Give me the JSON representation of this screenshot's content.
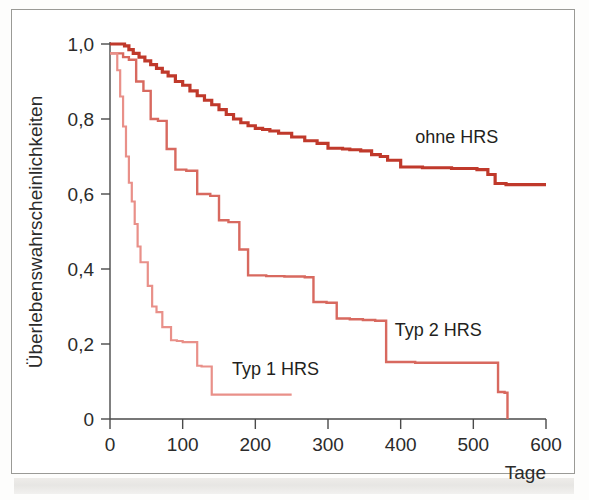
{
  "chart_data": {
    "type": "line",
    "subtype": "kaplan-meier-step",
    "title": "",
    "xlabel": "Tage",
    "ylabel": "Überlebenswahrscheinlichkeiten",
    "xlim": [
      0,
      600
    ],
    "ylim": [
      0,
      1.0
    ],
    "grid": false,
    "legend_position": "inline-annotations",
    "xticks": [
      0,
      100,
      200,
      300,
      400,
      500,
      600
    ],
    "xtick_labels": [
      "0",
      "100",
      "200",
      "300",
      "400",
      "500",
      "600"
    ],
    "yticks": [
      0,
      0.2,
      0.4,
      0.6,
      0.8,
      1.0
    ],
    "ytick_labels": [
      "0",
      "0,2",
      "0,4",
      "0,6",
      "0,8",
      "1,0"
    ],
    "series": [
      {
        "name": "ohne HRS",
        "color": "#C0392B",
        "label_text": "ohne HRS",
        "label_x": 420,
        "label_y": 0.735,
        "line_width": 3.2,
        "x": [
          0,
          14,
          20,
          26,
          32,
          40,
          48,
          56,
          64,
          72,
          80,
          90,
          100,
          110,
          120,
          130,
          140,
          150,
          160,
          170,
          180,
          190,
          200,
          210,
          220,
          232,
          250,
          268,
          285,
          300,
          320,
          330,
          345,
          360,
          372,
          382,
          400,
          430,
          470,
          505,
          520,
          530,
          545,
          600
        ],
        "y": [
          1.0,
          1.0,
          0.995,
          0.985,
          0.975,
          0.965,
          0.955,
          0.945,
          0.935,
          0.925,
          0.915,
          0.9,
          0.89,
          0.875,
          0.862,
          0.85,
          0.838,
          0.825,
          0.812,
          0.8,
          0.79,
          0.782,
          0.775,
          0.772,
          0.768,
          0.762,
          0.752,
          0.742,
          0.735,
          0.722,
          0.72,
          0.718,
          0.715,
          0.705,
          0.7,
          0.69,
          0.672,
          0.67,
          0.668,
          0.665,
          0.652,
          0.628,
          0.625,
          0.625
        ]
      },
      {
        "name": "Typ 2 HRS",
        "color": "#D8695F",
        "label_text": "Typ 2 HRS",
        "label_x": 392,
        "label_y": 0.222,
        "line_width": 2.4,
        "x": [
          0,
          10,
          18,
          26,
          36,
          46,
          56,
          66,
          78,
          90,
          105,
          120,
          138,
          150,
          163,
          178,
          190,
          215,
          240,
          268,
          280,
          298,
          312,
          330,
          348,
          365,
          380,
          420,
          470,
          505,
          522,
          534,
          543,
          547
        ],
        "y": [
          0.975,
          0.975,
          0.965,
          0.958,
          0.9,
          0.875,
          0.8,
          0.795,
          0.72,
          0.665,
          0.662,
          0.6,
          0.595,
          0.53,
          0.525,
          0.452,
          0.383,
          0.381,
          0.38,
          0.378,
          0.312,
          0.31,
          0.268,
          0.266,
          0.264,
          0.262,
          0.152,
          0.15,
          0.15,
          0.15,
          0.15,
          0.072,
          0.07,
          0.0
        ]
      },
      {
        "name": "Typ 1 HRS",
        "color": "#E99089",
        "label_text": "Typ 1 HRS",
        "label_x": 168,
        "label_y": 0.118,
        "line_width": 2.2,
        "x": [
          0,
          6,
          10,
          14,
          18,
          22,
          26,
          30,
          34,
          38,
          42,
          46,
          52,
          58,
          64,
          72,
          84,
          92,
          100,
          110,
          120,
          126,
          140,
          180,
          220,
          250
        ],
        "y": [
          0.975,
          0.975,
          0.93,
          0.86,
          0.78,
          0.7,
          0.63,
          0.58,
          0.52,
          0.46,
          0.418,
          0.418,
          0.355,
          0.3,
          0.285,
          0.245,
          0.21,
          0.208,
          0.205,
          0.205,
          0.142,
          0.14,
          0.065,
          0.065,
          0.065,
          0.065
        ]
      }
    ]
  },
  "axes": {
    "x_axis_name": "Tage",
    "y_axis_name": "Überlebenswahrscheinlichkeiten"
  }
}
